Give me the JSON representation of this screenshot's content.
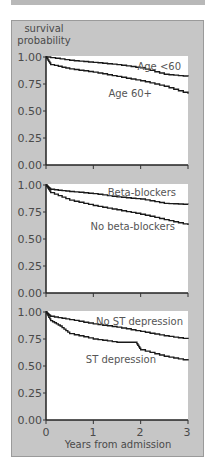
{
  "chart_data": [
    {
      "type": "line",
      "subtype": "kaplan-meier step",
      "ylabel": "survival probability",
      "xlabel": "",
      "xlim": [
        0,
        3
      ],
      "ylim": [
        0,
        1
      ],
      "y_ticks": [
        "1.00",
        "0.75",
        "0.50",
        "0.25",
        "0.00"
      ],
      "series": [
        {
          "name": "Age <60",
          "x": [
            0,
            0.5,
            1,
            1.5,
            2,
            2.5,
            3
          ],
          "values": [
            1.0,
            0.97,
            0.95,
            0.93,
            0.9,
            0.84,
            0.82
          ]
        },
        {
          "name": "Age 60+",
          "x": [
            0,
            0.1,
            0.5,
            1,
            1.5,
            2,
            2.5,
            3
          ],
          "values": [
            1.0,
            0.93,
            0.89,
            0.86,
            0.82,
            0.78,
            0.73,
            0.66
          ]
        }
      ]
    },
    {
      "type": "line",
      "subtype": "kaplan-meier step",
      "ylabel": "",
      "xlabel": "",
      "xlim": [
        0,
        3
      ],
      "ylim": [
        0,
        1
      ],
      "y_ticks": [
        "1.00",
        "0.75",
        "0.50",
        "0.25",
        "0.00"
      ],
      "series": [
        {
          "name": "Beta-blockers",
          "x": [
            0,
            0.1,
            0.5,
            1,
            1.5,
            2,
            2.5,
            3
          ],
          "values": [
            1.0,
            0.96,
            0.94,
            0.92,
            0.89,
            0.87,
            0.83,
            0.82
          ]
        },
        {
          "name": "No beta-blockers",
          "x": [
            0,
            0.1,
            0.5,
            1,
            1.5,
            2,
            2.5,
            3
          ],
          "values": [
            1.0,
            0.93,
            0.86,
            0.81,
            0.77,
            0.73,
            0.68,
            0.63
          ]
        }
      ]
    },
    {
      "type": "line",
      "subtype": "kaplan-meier step",
      "ylabel": "",
      "xlabel": "Years from admission",
      "xlim": [
        0,
        3
      ],
      "ylim": [
        0,
        1
      ],
      "x_ticks": [
        "0",
        "1",
        "2",
        "3"
      ],
      "y_ticks": [
        "1.00",
        "0.75",
        "0.50",
        "0.25",
        "0.00"
      ],
      "series": [
        {
          "name": "No ST depression",
          "x": [
            0,
            0.1,
            0.5,
            1,
            1.5,
            2,
            2.5,
            3
          ],
          "values": [
            1.0,
            0.96,
            0.93,
            0.89,
            0.86,
            0.82,
            0.78,
            0.75
          ]
        },
        {
          "name": "ST depression",
          "x": [
            0,
            0.1,
            0.3,
            0.5,
            1,
            1.5,
            1.9,
            2,
            2.5,
            3
          ],
          "values": [
            1.0,
            0.92,
            0.87,
            0.8,
            0.75,
            0.72,
            0.72,
            0.65,
            0.59,
            0.55
          ]
        }
      ]
    }
  ],
  "labels": {
    "ylabel_line1": "survival",
    "ylabel_line2": "probability",
    "xlabel": "Years from admission",
    "y_ticks": [
      "1.00",
      "0.75",
      "0.50",
      "0.25",
      "0.00"
    ],
    "x_ticks": [
      "0",
      "1",
      "2",
      "3"
    ],
    "panel1": {
      "upper": "Age <60",
      "lower": "Age 60+"
    },
    "panel2": {
      "upper": "Beta-blockers",
      "lower": "No beta-blockers"
    },
    "panel3": {
      "upper": "No ST depression",
      "lower": "ST depression"
    }
  },
  "colors": {
    "panel_bg": "#c6c6c6",
    "plot_bg": "#ffffff",
    "line": "#1a1a1a"
  }
}
